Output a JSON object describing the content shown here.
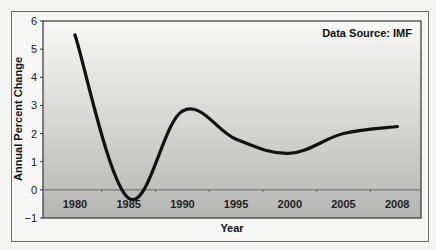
{
  "chart_data": {
    "type": "line",
    "title": "",
    "annotation": "Data Source: IMF",
    "xlabel": "Year",
    "ylabel": "Annual Percent Change",
    "categories": [
      "1980",
      "1985",
      "1990",
      "1995",
      "2000",
      "2005",
      "2008"
    ],
    "series": [
      {
        "name": "Annual Percent Change",
        "values": [
          5.5,
          -0.3,
          2.8,
          1.8,
          1.3,
          2.0,
          2.25
        ]
      }
    ],
    "ylim": [
      -1,
      6
    ],
    "yticks": [
      "-1",
      "0",
      "1",
      "2",
      "3",
      "4",
      "5",
      "6"
    ],
    "grid": false,
    "legend": "none",
    "colors": {
      "line": "#111111",
      "bg_top": "#f8f8f7",
      "bg_bottom": "#b5b5b4",
      "zero_line": "#666666"
    }
  }
}
